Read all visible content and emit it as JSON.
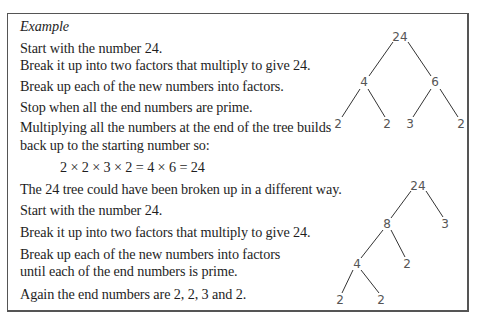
{
  "example": {
    "heading": "Example",
    "lines": [
      "Start with the number 24.",
      "Break it up into two factors that multiply to give 24.",
      "Break up each of the new numbers into factors.",
      "Stop when all the end numbers are prime.",
      "Multiplying all the numbers at the end of the tree builds",
      "back up to the starting number so:",
      "2 × 2 × 3 × 2 = 4 × 6 = 24",
      "The 24 tree could have been broken up in a different way.",
      "Start with the number 24.",
      "Break it up into two factors that multiply to give 24.",
      "Break up each of the new numbers into factors",
      "until each of the end numbers is prime.",
      "Again the end numbers are 2, 2, 3 and 2."
    ]
  },
  "tree1": {
    "root": "24",
    "level1": [
      "4",
      "6"
    ],
    "leaves": [
      "2",
      "2",
      "3",
      "2"
    ]
  },
  "tree2": {
    "root": "24",
    "level1": [
      "8",
      "3"
    ],
    "level2": [
      "4",
      "2"
    ],
    "leaves": [
      "2",
      "2"
    ]
  }
}
